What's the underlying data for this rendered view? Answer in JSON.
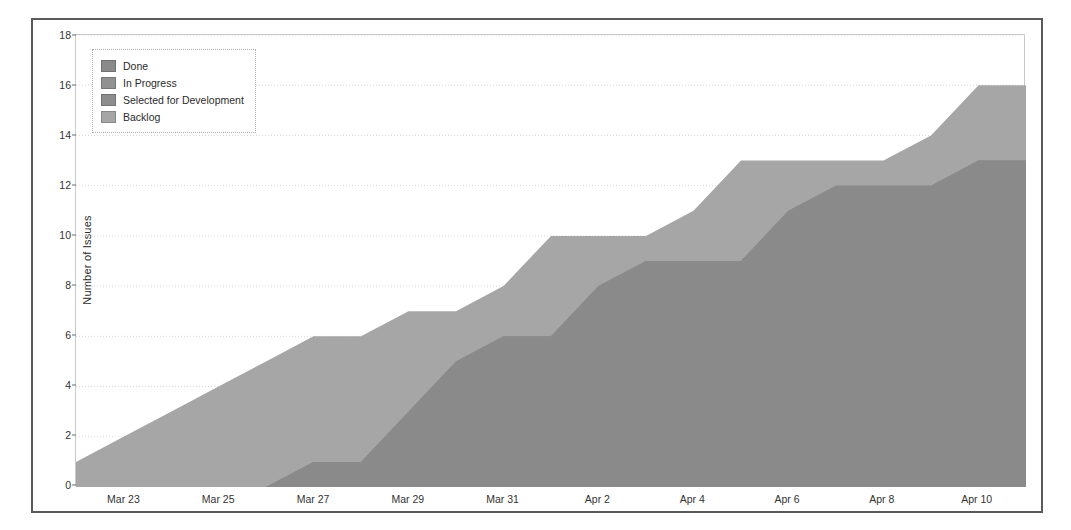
{
  "chart_data": {
    "type": "area",
    "title": "",
    "xlabel": "",
    "ylabel": "Number of Issues",
    "stacked": true,
    "grid": true,
    "legend_position": "top-left",
    "ylim": [
      0,
      18
    ],
    "yticks": [
      0,
      2,
      4,
      6,
      8,
      10,
      12,
      14,
      16,
      18
    ],
    "xlim": [
      "Mar 22",
      "Apr 11"
    ],
    "xticks": [
      "Mar 23",
      "Mar 25",
      "Mar 27",
      "Mar 29",
      "Mar 31",
      "Apr 2",
      "Apr 4",
      "Apr 6",
      "Apr 8",
      "Apr 10"
    ],
    "x": [
      "Mar 22",
      "Mar 23",
      "Mar 24",
      "Mar 25",
      "Mar 26",
      "Mar 27",
      "Mar 28",
      "Mar 29",
      "Mar 30",
      "Mar 31",
      "Apr 1",
      "Apr 2",
      "Apr 3",
      "Apr 4",
      "Apr 5",
      "Apr 6",
      "Apr 7",
      "Apr 8",
      "Apr 9",
      "Apr 10",
      "Apr 11"
    ],
    "series": [
      {
        "name": "Done",
        "color": "#8a8a8a",
        "values": [
          0,
          0,
          0,
          0,
          0,
          1,
          1,
          3,
          5,
          6,
          6,
          8,
          9,
          9,
          9,
          11,
          12,
          12,
          12,
          13,
          13
        ]
      },
      {
        "name": "In Progress",
        "color": "#919191",
        "values": [
          0,
          0,
          0,
          0,
          0,
          0,
          0,
          0,
          0,
          0,
          0,
          0,
          0,
          0,
          0,
          0,
          0,
          0,
          0,
          0,
          0
        ]
      },
      {
        "name": "Selected for Development",
        "color": "#8d8d8d",
        "values": [
          0,
          0,
          0,
          0,
          0,
          0,
          0,
          0,
          0,
          0,
          0,
          0,
          0,
          0,
          0,
          0,
          0,
          0,
          0,
          0,
          0
        ]
      },
      {
        "name": "Backlog",
        "color": "#a6a6a6",
        "values": [
          1,
          2,
          3,
          4,
          5,
          5,
          5,
          4,
          2,
          2,
          4,
          2,
          1,
          2,
          4,
          2,
          1,
          1,
          2,
          3,
          3
        ]
      }
    ],
    "totals": [
      1,
      2,
      3,
      4,
      5,
      6,
      6,
      7,
      7,
      8,
      10,
      10,
      10,
      11,
      13,
      13,
      13,
      13,
      14,
      16,
      16
    ]
  },
  "legend": {
    "items": [
      {
        "label": "Done",
        "color": "#8a8a8a"
      },
      {
        "label": "In Progress",
        "color": "#919191"
      },
      {
        "label": "Selected for Development",
        "color": "#8d8d8d"
      },
      {
        "label": "Backlog",
        "color": "#a6a6a6"
      }
    ]
  },
  "axes": {
    "y_title": "Number of Issues"
  }
}
